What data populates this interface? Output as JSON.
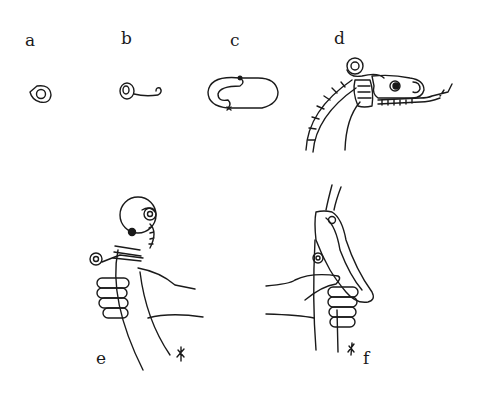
{
  "figure": {
    "panels": [
      {
        "id": "a",
        "label": "a",
        "subject": "dragon eye motif"
      },
      {
        "id": "b",
        "label": "b",
        "subject": "eye with scroll tendril"
      },
      {
        "id": "c",
        "label": "c",
        "subject": "looped outline"
      },
      {
        "id": "d",
        "label": "d",
        "subject": "dragon head with neck"
      },
      {
        "id": "e",
        "label": "e",
        "subject": "hand gripping dragon-head handle"
      },
      {
        "id": "f",
        "label": "f",
        "subject": "hand gripping clasp handle"
      }
    ],
    "stroke_color": "#1a1a1a",
    "background": "#ffffff"
  }
}
